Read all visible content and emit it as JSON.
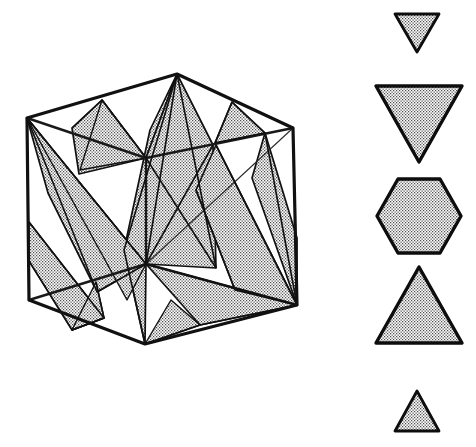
{
  "figure": {
    "background_color": "#ffffff",
    "line_color": "#111111",
    "fill_pattern": "stipple-dots",
    "fill_dot_color": "#555555",
    "width": 476,
    "height": 447
  },
  "cube": {
    "name": "cube-diagram",
    "vertices": {
      "top_apex": {
        "label": "top-apex",
        "x": 177,
        "y": 74
      },
      "left_top_back": {
        "label": "left-top-back",
        "x": 27,
        "y": 118
      },
      "right_top_back": {
        "label": "right-top-back",
        "x": 293,
        "y": 128
      },
      "center_top_front": {
        "label": "center-top-front",
        "x": 146,
        "y": 158
      },
      "left_bottom_back": {
        "label": "left-bottom-back",
        "x": 29,
        "y": 300
      },
      "right_bottom": {
        "label": "right-bottom",
        "x": 297,
        "y": 305
      },
      "bottom_apex": {
        "label": "bottom-apex",
        "x": 145,
        "y": 344
      },
      "center_bottom_front": {
        "label": "center-bottom-front",
        "x": 146,
        "y": 264
      }
    },
    "outer_silhouette": "27,118 177,74 293,128 297,305 145,344 29,300",
    "visible_edges": [
      "27,118 146,158 293,128",
      "146,158 146,264",
      "29,300 146,264 297,305"
    ],
    "vertical_edges": [
      "27,118 29,300",
      "293,128 297,305",
      "177,74 177,? ",
      "145,344 146,264"
    ]
  },
  "cross_sections_in_cube": {
    "name": "interior-section-planes",
    "count": 9,
    "description": "Stippled triangular and polygonal cross-section faces drawn inside the cube"
  },
  "legend": {
    "name": "cross-section-sequence",
    "description": "Successive cross-sections of the cube taken perpendicular to a space diagonal, from one corner to the opposite corner",
    "shapes": [
      {
        "index": 1,
        "name": "small-inverted-triangle",
        "type": "triangle",
        "orientation": "point-down",
        "sides": 3,
        "center_x": 417,
        "center_y": 33,
        "width": 44,
        "height": 38
      },
      {
        "index": 2,
        "name": "large-inverted-triangle",
        "type": "triangle",
        "orientation": "point-down",
        "sides": 3,
        "center_x": 419,
        "center_y": 124,
        "width": 86,
        "height": 76
      },
      {
        "index": 3,
        "name": "regular-hexagon",
        "type": "hexagon",
        "orientation": "flat-top",
        "sides": 6,
        "center_x": 419,
        "center_y": 216,
        "width": 84,
        "height": 74
      },
      {
        "index": 4,
        "name": "large-upright-triangle",
        "type": "triangle",
        "orientation": "point-up",
        "sides": 3,
        "center_x": 419,
        "center_y": 305,
        "width": 86,
        "height": 76
      },
      {
        "index": 5,
        "name": "small-upright-triangle",
        "type": "triangle",
        "orientation": "point-up",
        "sides": 3,
        "center_x": 417,
        "center_y": 411,
        "width": 44,
        "height": 40
      }
    ]
  }
}
